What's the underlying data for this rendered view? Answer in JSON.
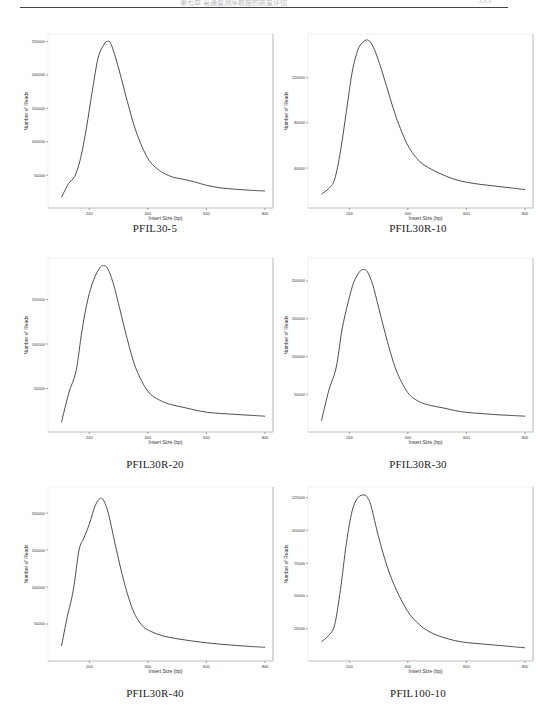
{
  "page": {
    "header_text": "第七章  高通量测序数据的质量评估",
    "page_number": "333"
  },
  "chart_data": [
    {
      "type": "line",
      "title": "PFIL30-5",
      "xlabel": "Insert Size (bp)",
      "ylabel": "Number of Reads",
      "xlim": [
        100,
        800
      ],
      "ylim": [
        10000,
        255000
      ],
      "xticks": [
        200,
        400,
        600,
        800
      ],
      "yticks": [
        50000,
        100000,
        150000,
        200000,
        250000
      ],
      "ytick_labels": [
        "50000",
        "100000",
        "150000",
        "200000",
        "250000"
      ],
      "grid": false,
      "x": [
        105,
        130,
        150,
        170,
        190,
        210,
        230,
        250,
        262,
        275,
        300,
        330,
        360,
        400,
        440,
        480,
        520,
        560,
        600,
        650,
        700,
        750,
        800
      ],
      "values": [
        17000,
        38000,
        48000,
        75000,
        120000,
        175000,
        225000,
        245000,
        250000,
        245000,
        210000,
        160000,
        115000,
        75000,
        57000,
        48000,
        44000,
        40000,
        35000,
        31000,
        29000,
        27500,
        26500
      ]
    },
    {
      "type": "line",
      "title": "PFIL30R-10",
      "xlabel": "Insert Size (bp)",
      "ylabel": "Number of Reads",
      "xlim": [
        100,
        800
      ],
      "ylim": [
        10000,
        155000
      ],
      "xticks": [
        200,
        400,
        600,
        800
      ],
      "yticks": [
        40000,
        80000,
        120000
      ],
      "ytick_labels": [
        "40000",
        "80000",
        "120000"
      ],
      "grid": false,
      "x": [
        105,
        130,
        150,
        170,
        190,
        210,
        230,
        250,
        265,
        280,
        300,
        330,
        360,
        400,
        440,
        480,
        520,
        560,
        600,
        650,
        700,
        750,
        800
      ],
      "values": [
        17000,
        22000,
        30000,
        55000,
        90000,
        125000,
        145000,
        152000,
        153000,
        148000,
        135000,
        110000,
        85000,
        60000,
        46000,
        39000,
        34000,
        30000,
        27500,
        25500,
        24000,
        22500,
        21000
      ]
    },
    {
      "type": "line",
      "title": "PFIL30R-20",
      "xlabel": "Insert Size (bp)",
      "ylabel": "Number of Reads",
      "xlim": [
        100,
        800
      ],
      "ylim": [
        8000,
        192000
      ],
      "xticks": [
        200,
        400,
        600,
        800
      ],
      "yticks": [
        50000,
        100000,
        150000
      ],
      "ytick_labels": [
        "50000",
        "100000",
        "150000"
      ],
      "grid": false,
      "x": [
        105,
        130,
        155,
        175,
        195,
        215,
        235,
        248,
        262,
        280,
        300,
        330,
        360,
        400,
        440,
        480,
        520,
        560,
        600,
        650,
        700,
        750,
        800
      ],
      "values": [
        12000,
        45000,
        70000,
        115000,
        150000,
        172000,
        185000,
        188000,
        185000,
        170000,
        145000,
        105000,
        72000,
        47000,
        37000,
        32000,
        29000,
        26000,
        23500,
        22000,
        21000,
        20000,
        19000
      ]
    },
    {
      "type": "line",
      "title": "PFIL30R-30",
      "xlabel": "Insert Size (bp)",
      "ylabel": "Number of Reads",
      "xlim": [
        100,
        800
      ],
      "ylim": [
        8000,
        225000
      ],
      "xticks": [
        200,
        400,
        600,
        800
      ],
      "yticks": [
        50000,
        100000,
        150000,
        200000
      ],
      "ytick_labels": [
        "50000",
        "100000",
        "150000",
        "200000"
      ],
      "grid": false,
      "x": [
        105,
        130,
        155,
        175,
        195,
        215,
        235,
        248,
        262,
        280,
        300,
        330,
        360,
        400,
        440,
        480,
        520,
        560,
        600,
        650,
        700,
        750,
        800
      ],
      "values": [
        15000,
        55000,
        85000,
        135000,
        170000,
        198000,
        212000,
        215000,
        212000,
        195000,
        165000,
        120000,
        82000,
        52000,
        40000,
        35000,
        32000,
        28500,
        26000,
        24500,
        23000,
        22000,
        21000
      ]
    },
    {
      "type": "line",
      "title": "PFIL30R-40",
      "xlabel": "Insert Size (bp)",
      "ylabel": "Number of Reads",
      "xlim": [
        100,
        800
      ],
      "ylim": [
        8000,
        230000
      ],
      "xticks": [
        200,
        400,
        600,
        800
      ],
      "yticks": [
        50000,
        100000,
        150000,
        200000
      ],
      "ytick_labels": [
        "50000",
        "100000",
        "150000",
        "200000"
      ],
      "grid": false,
      "x": [
        105,
        125,
        145,
        165,
        180,
        200,
        220,
        238,
        252,
        268,
        290,
        320,
        350,
        380,
        410,
        450,
        500,
        550,
        600,
        650,
        700,
        750,
        800
      ],
      "values": [
        20000,
        60000,
        95000,
        150000,
        165000,
        185000,
        210000,
        220000,
        215000,
        195000,
        155000,
        105000,
        68000,
        48000,
        40000,
        34000,
        30000,
        27000,
        24500,
        22500,
        21000,
        19500,
        18500
      ]
    },
    {
      "type": "line",
      "title": "PFIL100-10",
      "xlabel": "Insert Size (bp)",
      "ylabel": "Number of Reads",
      "xlim": [
        100,
        800
      ],
      "ylim": [
        5000,
        130000
      ],
      "xticks": [
        200,
        400,
        600,
        800
      ],
      "yticks": [
        25000,
        50000,
        75000,
        100000,
        125000
      ],
      "ytick_labels": [
        "25000",
        "50000",
        "75000",
        "100000",
        "125000"
      ],
      "grid": false,
      "x": [
        105,
        130,
        150,
        170,
        190,
        210,
        230,
        250,
        262,
        275,
        300,
        330,
        360,
        400,
        440,
        480,
        520,
        560,
        600,
        650,
        700,
        750,
        800
      ],
      "values": [
        15000,
        20000,
        28000,
        55000,
        90000,
        115000,
        125000,
        127000,
        125000,
        118000,
        95000,
        72000,
        55000,
        38000,
        28000,
        22000,
        18500,
        16000,
        14500,
        13500,
        12500,
        11500,
        10500
      ]
    }
  ]
}
